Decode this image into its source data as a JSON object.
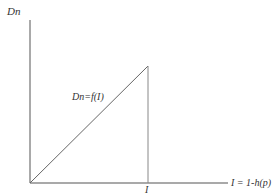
{
  "diagram": {
    "y_axis_label": "Dn",
    "x_axis_label": "I = 1-h(p)",
    "curve_label": "Dn=f(I)",
    "x_tick_label": "I",
    "colors": {
      "axis": "#555555",
      "curve": "#666666",
      "drop_line": "#888888",
      "text": "#333333"
    }
  }
}
